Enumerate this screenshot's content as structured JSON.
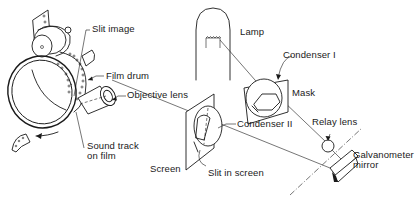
{
  "figure": {
    "labels": {
      "slit_image": "Slit image",
      "film_drum": "Film drum",
      "objective_lens": "Objective lens",
      "sound_track_line1": "Sound track",
      "sound_track_line2": "on film",
      "lamp": "Lamp",
      "condenser_1": "Condenser I",
      "mask": "Mask",
      "condenser_2": "Condenser II",
      "relay_lens": "Relay lens",
      "screen": "Screen",
      "slit_in_screen": "Slit in screen",
      "galvanometer_line1": "Galvanometer",
      "galvanometer_line2": "mirror"
    },
    "colors": {
      "ink": "#1a1a1a",
      "background": "#ffffff"
    }
  }
}
